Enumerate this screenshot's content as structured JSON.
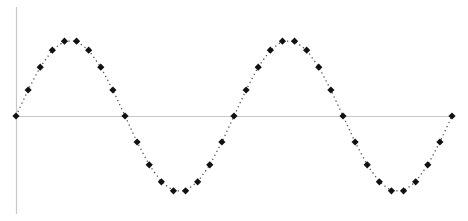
{
  "chart_data": {
    "type": "line",
    "title": "",
    "xlabel": "",
    "ylabel": "",
    "grid": false,
    "legend": null,
    "x": [
      0,
      1,
      2,
      3,
      4,
      5,
      6,
      7,
      8,
      9,
      10,
      11,
      12,
      13,
      14,
      15,
      16,
      17,
      18,
      19,
      20,
      21,
      22,
      23,
      24,
      25,
      26,
      27,
      28,
      29,
      30,
      31,
      32,
      33,
      34,
      35,
      36
    ],
    "series": [
      {
        "name": "sine",
        "marker": "diamond",
        "line_style": "dotted",
        "values": [
          0,
          0.342,
          0.643,
          0.866,
          0.985,
          0.985,
          0.866,
          0.643,
          0.342,
          0,
          -0.342,
          -0.643,
          -0.866,
          -0.985,
          -0.985,
          -0.866,
          -0.643,
          -0.342,
          0,
          0.342,
          0.643,
          0.866,
          0.985,
          0.985,
          0.866,
          0.643,
          0.342,
          0,
          -0.342,
          -0.643,
          -0.866,
          -0.985,
          -0.985,
          -0.866,
          -0.643,
          -0.342,
          0
        ]
      }
    ],
    "xlim": [
      0,
      36
    ],
    "ylim": [
      -1,
      1
    ],
    "colors": {
      "marker": "#111111",
      "line": "#555555",
      "axis": "#c8c8c8"
    }
  }
}
